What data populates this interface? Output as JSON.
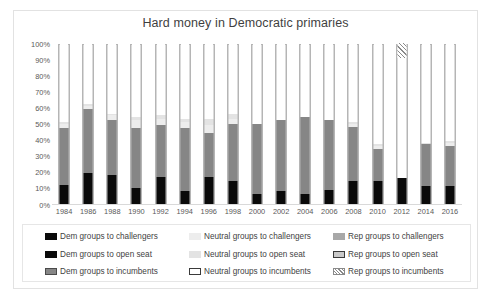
{
  "chart_data": {
    "type": "bar",
    "title": "Hard money in Democratic primaries",
    "xlabel": "",
    "ylabel": "",
    "ylim": [
      0,
      100
    ],
    "stacked": true,
    "stack_mode": "percent",
    "grid": false,
    "legend_position": "bottom",
    "ytick_labels": [
      "100%",
      "90%",
      "80%",
      "70%",
      "60%",
      "50%",
      "40%",
      "30%",
      "20%",
      "10%",
      "0%"
    ],
    "ytick_values": [
      100,
      90,
      80,
      70,
      60,
      50,
      40,
      30,
      20,
      10,
      0
    ],
    "categories": [
      "1984",
      "1986",
      "1988",
      "1990",
      "1992",
      "1994",
      "1996",
      "1998",
      "2000",
      "2002",
      "2004",
      "2006",
      "2008",
      "2010",
      "2012",
      "2014",
      "2016"
    ],
    "series": [
      {
        "name": "Dem groups to challengers",
        "key": "dem-chal",
        "color": "#0a0a0a",
        "values": [
          4,
          12,
          10,
          5,
          8,
          5,
          9,
          6,
          3,
          4,
          3,
          5,
          6,
          5,
          7,
          5,
          5
        ]
      },
      {
        "name": "Dem groups to open seat",
        "key": "dem-open",
        "color": "#0a0a0a",
        "values": [
          8,
          7,
          8,
          5,
          9,
          3,
          8,
          8,
          3,
          4,
          3,
          4,
          8,
          9,
          9,
          6,
          6
        ]
      },
      {
        "name": "Dem groups to incumbents",
        "key": "dem-inc",
        "color": "#868686",
        "values": [
          35,
          40,
          34,
          37,
          32,
          39,
          27,
          36,
          44,
          44,
          48,
          43,
          34,
          20,
          0,
          26,
          25
        ]
      },
      {
        "name": "Neutral groups to challengers",
        "key": "neu-chal",
        "color": "#ededed",
        "values": [
          3,
          2,
          3,
          5,
          4,
          4,
          5,
          3,
          0,
          0,
          0,
          0,
          2,
          2,
          0,
          0,
          2
        ]
      },
      {
        "name": "Neutral groups to open seat",
        "key": "neu-open",
        "color": "#e3e3e3",
        "values": [
          1,
          1,
          1,
          2,
          2,
          2,
          4,
          3,
          0,
          0,
          0,
          0,
          1,
          1,
          0,
          1,
          1
        ]
      },
      {
        "name": "Neutral groups to incumbents",
        "key": "neu-inc",
        "color": "#ffffff",
        "values": [
          49,
          38,
          44,
          46,
          45,
          47,
          47,
          44,
          50,
          48,
          46,
          48,
          49,
          63,
          75,
          62,
          61
        ]
      },
      {
        "name": "Rep groups to challengers",
        "key": "rep-chal",
        "color": "#a8a8a8",
        "values": [
          0,
          0,
          0,
          0,
          0,
          0,
          0,
          0,
          0,
          0,
          0,
          0,
          0,
          0,
          0,
          0,
          0
        ]
      },
      {
        "name": "Rep groups to open seat",
        "key": "rep-open",
        "color": "#c9c9c9",
        "values": [
          0,
          0,
          0,
          0,
          0,
          0,
          0,
          0,
          0,
          0,
          0,
          0,
          0,
          0,
          0,
          0,
          0
        ]
      },
      {
        "name": "Rep groups to incumbents",
        "key": "rep-inc",
        "color": "#ffffff",
        "hatched": true,
        "values": [
          0,
          0,
          0,
          0,
          0,
          0,
          0,
          0,
          0,
          0,
          0,
          0,
          0,
          0,
          9,
          0,
          0
        ]
      }
    ]
  },
  "legend": {
    "items": [
      {
        "label": "Dem groups to challengers",
        "key": "dem-chal"
      },
      {
        "label": "Neutral groups to challengers",
        "key": "neu-chal"
      },
      {
        "label": "Rep groups to challengers",
        "key": "rep-chal"
      },
      {
        "label": "Dem groups to open seat",
        "key": "dem-open"
      },
      {
        "label": "Neutral groups to open seat",
        "key": "neu-open"
      },
      {
        "label": "Rep groups to open seat",
        "key": "rep-open"
      },
      {
        "label": "Dem groups to incumbents",
        "key": "dem-inc"
      },
      {
        "label": "Neutral groups to incumbents",
        "key": "neu-inc"
      },
      {
        "label": "Rep groups to incumbents",
        "key": "rep-inc"
      }
    ]
  }
}
